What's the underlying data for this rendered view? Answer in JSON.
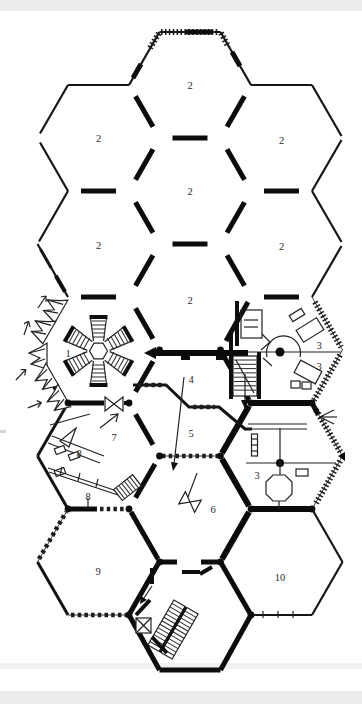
{
  "figure": {
    "kind": "architectural-floor-plan"
  },
  "colors": {
    "ink": "#141414",
    "paper": "#ffffff",
    "scan_band": "#eeedeb"
  },
  "room_labels": [
    {
      "id": "room2-top",
      "text": "2"
    },
    {
      "id": "room2-upper-left",
      "text": "2"
    },
    {
      "id": "room2-upper-right",
      "text": "2"
    },
    {
      "id": "room2-mid",
      "text": "2"
    },
    {
      "id": "room2-left",
      "text": "2"
    },
    {
      "id": "room2-right",
      "text": "2"
    },
    {
      "id": "room2-lower-mid",
      "text": "2"
    },
    {
      "id": "room1",
      "text": "1"
    },
    {
      "id": "room3-a",
      "text": "3"
    },
    {
      "id": "room3-b",
      "text": "3"
    },
    {
      "id": "room4",
      "text": "4"
    },
    {
      "id": "room5",
      "text": "5"
    },
    {
      "id": "room7",
      "text": "7"
    },
    {
      "id": "room8-a",
      "text": "8"
    },
    {
      "id": "room8-b",
      "text": "8"
    },
    {
      "id": "room6",
      "text": "6"
    },
    {
      "id": "room3-c",
      "text": "3"
    },
    {
      "id": "room9",
      "text": "9"
    },
    {
      "id": "room10",
      "text": "10"
    }
  ]
}
